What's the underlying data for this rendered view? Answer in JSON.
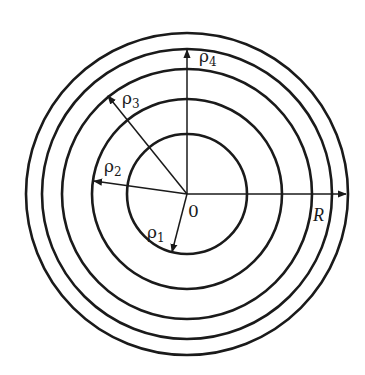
{
  "diagram": {
    "type": "concentric-circles-with-radii",
    "center": {
      "x": 187,
      "y": 194
    },
    "circles": [
      {
        "id": "rho1",
        "radius": 60
      },
      {
        "id": "rho2",
        "radius": 95
      },
      {
        "id": "rho3",
        "radius": 125
      },
      {
        "id": "rho4",
        "radius": 145
      },
      {
        "id": "R",
        "radius": 161
      }
    ],
    "labels": {
      "origin": "0",
      "rho_symbol": "ρ",
      "rho1_sub": "1",
      "rho2_sub": "2",
      "rho3_sub": "3",
      "rho4_sub": "4",
      "outer_radius": "R"
    },
    "stroke_color": "#1a1a1a",
    "background": "#ffffff"
  }
}
